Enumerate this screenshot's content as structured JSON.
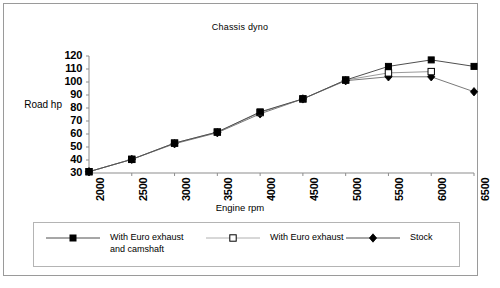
{
  "chart_data": {
    "type": "line",
    "title": "Chassis dyno",
    "xlabel": "Engine rpm",
    "ylabel": "Road hp",
    "x": [
      2000,
      2500,
      3000,
      3500,
      4000,
      4500,
      5000,
      5500,
      6000,
      6500
    ],
    "xtick_labels": [
      "2000",
      "2500",
      "3000",
      "3500",
      "4000",
      "4500",
      "5000",
      "5500",
      "6000",
      "6500"
    ],
    "ytick_labels": [
      "120",
      "110",
      "100",
      "90",
      "80",
      "70",
      "60",
      "50",
      "40",
      "30"
    ],
    "ylim": [
      30,
      120
    ],
    "ytick_step": 10,
    "grid": false,
    "legend_position": "bottom",
    "series": [
      {
        "name": "With Euro exhaust\nand camshaft",
        "marker": "filled-square",
        "color": "#000000",
        "values": [
          31,
          40.5,
          53,
          61.5,
          77,
          87,
          101.5,
          112,
          117,
          112
        ]
      },
      {
        "name": "With Euro exhaust",
        "marker": "open-square",
        "color": "#000000",
        "values": [
          31,
          40.5,
          53,
          61.5,
          76.5,
          87,
          101.5,
          107,
          108,
          null
        ]
      },
      {
        "name": "Stock",
        "marker": "filled-diamond",
        "color": "#000000",
        "values": [
          31,
          40.5,
          52.5,
          61,
          75.5,
          87,
          101,
          104,
          104,
          92.5
        ]
      }
    ]
  },
  "legend": {
    "entries": [
      {
        "label": "With Euro exhaust\nand camshaft",
        "marker": "filled-square"
      },
      {
        "label": "With Euro exhaust",
        "marker": "open-square"
      },
      {
        "label": "Stock",
        "marker": "filled-diamond"
      }
    ]
  }
}
